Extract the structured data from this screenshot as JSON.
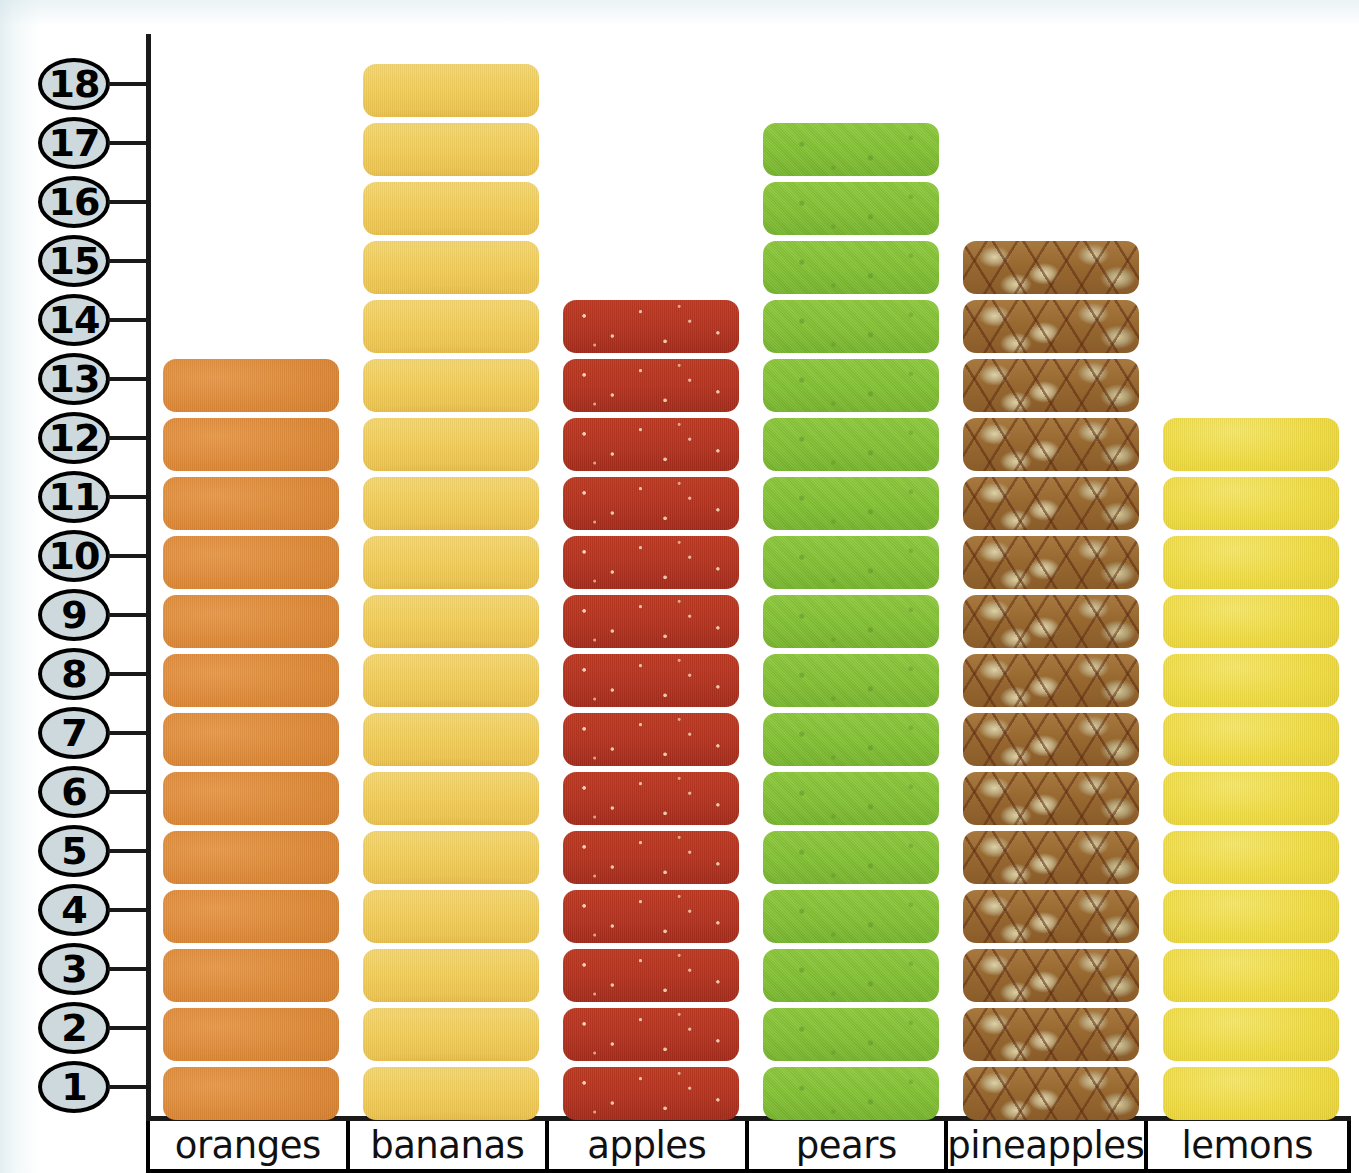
{
  "chart_data": {
    "type": "bar",
    "title": "",
    "subtitle": "",
    "xlabel": "",
    "ylabel": "",
    "ylim": [
      0,
      18
    ],
    "grid": false,
    "legend": "none",
    "note": "Pictograph bar chart: each rounded block equals one unit of fruit.",
    "categories": [
      "oranges",
      "bananas",
      "apples",
      "pears",
      "pineapples",
      "lemons"
    ],
    "values": [
      13,
      18,
      14,
      17,
      15,
      12
    ],
    "y_ticks": [
      18,
      17,
      16,
      15,
      14,
      13,
      12,
      11,
      10,
      9,
      8,
      7,
      6,
      5,
      4,
      3,
      2,
      1
    ],
    "colors": {
      "oranges": "#e08a3c",
      "bananas": "#f2ce5a",
      "apples": "#b53320",
      "pears": "#84c236",
      "pineapples": "#96672f",
      "lemons": "#f0dc42",
      "axis": "#1a1a1a",
      "tick_badge_fill": "#cdd9dc",
      "tick_badge_border": "#000000",
      "background": "#ffffff"
    }
  },
  "axis": {
    "ticks": [
      {
        "value": "18"
      },
      {
        "value": "17"
      },
      {
        "value": "16"
      },
      {
        "value": "15"
      },
      {
        "value": "14"
      },
      {
        "value": "13"
      },
      {
        "value": "12"
      },
      {
        "value": "11"
      },
      {
        "value": "10"
      },
      {
        "value": "9"
      },
      {
        "value": "8"
      },
      {
        "value": "7"
      },
      {
        "value": "6"
      },
      {
        "value": "5"
      },
      {
        "value": "4"
      },
      {
        "value": "3"
      },
      {
        "value": "2"
      },
      {
        "value": "1"
      }
    ]
  },
  "columns": [
    {
      "label": "oranges",
      "count": 13,
      "style": "b-oranges"
    },
    {
      "label": "bananas",
      "count": 18,
      "style": "b-bananas"
    },
    {
      "label": "apples",
      "count": 14,
      "style": "b-apples"
    },
    {
      "label": "pears",
      "count": 17,
      "style": "b-pears"
    },
    {
      "label": "pineapples",
      "count": 15,
      "style": "b-pineapples"
    },
    {
      "label": "lemons",
      "count": 12,
      "style": "b-lemons"
    }
  ]
}
